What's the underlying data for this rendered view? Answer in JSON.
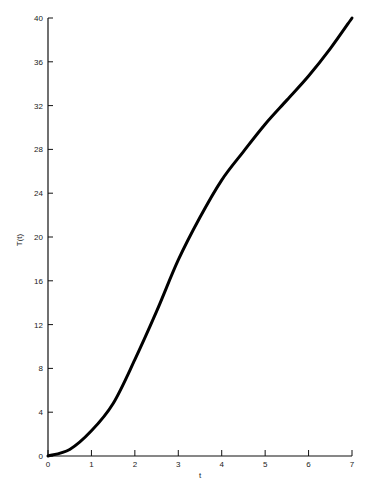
{
  "chart_data": {
    "type": "line",
    "title": "",
    "xlabel": "t",
    "ylabel": "T(t)",
    "xlim": [
      0,
      7
    ],
    "ylim": [
      0,
      40
    ],
    "grid": false,
    "legend": null,
    "x_ticks": [
      0,
      1,
      2,
      3,
      4,
      5,
      6,
      7
    ],
    "y_ticks": [
      0,
      4,
      8,
      12,
      16,
      20,
      24,
      28,
      32,
      36,
      40
    ],
    "series": [
      {
        "name": "T(t)",
        "color": "#000000",
        "x": [
          0,
          0.5,
          1,
          1.5,
          2,
          2.5,
          3,
          3.5,
          4,
          4.5,
          5,
          5.5,
          6,
          6.5,
          7
        ],
        "values": [
          0,
          0.6,
          2.3,
          4.8,
          8.8,
          13.2,
          17.9,
          21.8,
          25.2,
          27.8,
          30.3,
          32.5,
          34.7,
          37.2,
          40
        ]
      }
    ]
  }
}
